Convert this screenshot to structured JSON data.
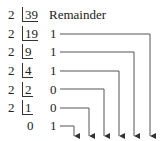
{
  "diagram": {
    "header_label": "Remainder",
    "divisor": "2",
    "rows": [
      {
        "divisor": "2",
        "dividend": "39",
        "remainder": ""
      },
      {
        "divisor": "2",
        "dividend": "19",
        "remainder": "1"
      },
      {
        "divisor": "2",
        "dividend": "9",
        "remainder": "1"
      },
      {
        "divisor": "2",
        "dividend": "4",
        "remainder": "1"
      },
      {
        "divisor": "2",
        "dividend": "2",
        "remainder": "0"
      },
      {
        "divisor": "2",
        "dividend": "1",
        "remainder": "0"
      },
      {
        "divisor": "",
        "dividend": "0",
        "remainder": "1"
      }
    ],
    "arrow_count": 6,
    "line_color": "#555555"
  }
}
